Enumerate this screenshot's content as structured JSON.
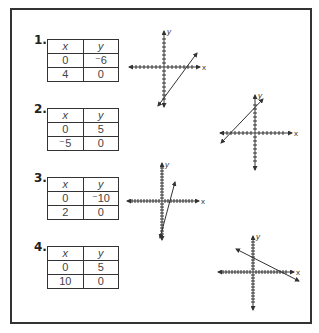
{
  "problems": [
    {
      "number": "1.",
      "table": {
        "headers": [
          "x",
          "y"
        ],
        "rows": [
          [
            "0",
            "⁻6"
          ],
          [
            "4",
            "0"
          ]
        ]
      },
      "graph": {
        "x_label": "x",
        "y_label": "y",
        "line": {
          "x_intercept": 4,
          "y_intercept": -6
        }
      }
    },
    {
      "number": "2.",
      "table": {
        "headers": [
          "x",
          "y"
        ],
        "rows": [
          [
            "0",
            "5"
          ],
          [
            "⁻5",
            "0"
          ]
        ]
      },
      "graph": {
        "x_label": "x",
        "y_label": "y",
        "line": {
          "x_intercept": -5,
          "y_intercept": 5
        }
      }
    },
    {
      "number": "3.",
      "table": {
        "headers": [
          "x",
          "y"
        ],
        "rows": [
          [
            "0",
            "⁻10"
          ],
          [
            "2",
            "0"
          ]
        ]
      },
      "graph": {
        "x_label": "x",
        "y_label": "y",
        "line": {
          "x_intercept": 2,
          "y_intercept": -10
        }
      }
    },
    {
      "number": "4.",
      "table": {
        "headers": [
          "x",
          "y"
        ],
        "rows": [
          [
            "0",
            "5"
          ],
          [
            "10",
            "0"
          ]
        ]
      },
      "graph": {
        "x_label": "x",
        "y_label": "y",
        "line": {
          "x_intercept": 10,
          "y_intercept": 5
        }
      }
    }
  ]
}
